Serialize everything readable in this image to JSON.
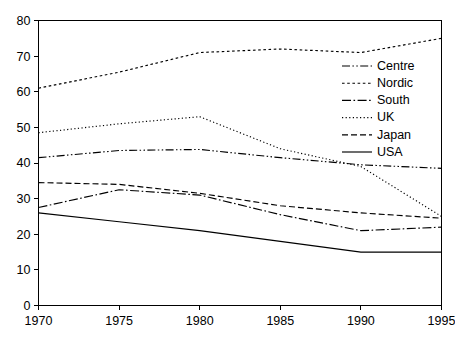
{
  "chart_data": {
    "type": "line",
    "title": "",
    "subtitle": "",
    "xlabel": "",
    "ylabel": "",
    "x": [
      1970,
      1975,
      1980,
      1985,
      1990,
      1995
    ],
    "xlim": [
      1970,
      1995
    ],
    "ylim": [
      0,
      80
    ],
    "x_ticks": [
      "1970",
      "1975",
      "1980",
      "1985",
      "1990",
      "1995"
    ],
    "y_ticks": [
      "0",
      "10",
      "20",
      "30",
      "40",
      "50",
      "60",
      "70",
      "80"
    ],
    "grid": false,
    "legend_position": "upper-right-inside",
    "line_color": "#000000",
    "background_color": "#ffffff",
    "series": [
      {
        "name": "Centre",
        "dash": "dash-dot-dot",
        "values": [
          41.5,
          43.5,
          43.8,
          41.5,
          39.5,
          38.5
        ]
      },
      {
        "name": "Nordic",
        "dash": "dotted-coarse",
        "values": [
          61.0,
          65.5,
          71.0,
          72.0,
          71.0,
          75.0
        ]
      },
      {
        "name": "South",
        "dash": "dash-dot",
        "values": [
          27.5,
          32.5,
          31.0,
          25.5,
          21.0,
          22.0
        ]
      },
      {
        "name": "UK",
        "dash": "dotted-fine",
        "values": [
          48.5,
          51.0,
          53.0,
          44.0,
          39.0,
          25.0
        ]
      },
      {
        "name": "Japan",
        "dash": "dashed",
        "values": [
          34.5,
          34.0,
          31.5,
          28.0,
          26.0,
          24.5
        ]
      },
      {
        "name": "USA",
        "dash": "solid",
        "values": [
          26.0,
          23.5,
          21.0,
          18.0,
          15.0,
          15.0
        ]
      }
    ]
  },
  "legend": {
    "items": [
      {
        "label": "Centre"
      },
      {
        "label": "Nordic"
      },
      {
        "label": "South"
      },
      {
        "label": "UK"
      },
      {
        "label": "Japan"
      },
      {
        "label": "USA"
      }
    ]
  },
  "axes": {
    "y_tick_labels": [
      "80",
      "70",
      "60",
      "50",
      "40",
      "30",
      "20",
      "10",
      "0"
    ],
    "x_tick_labels": [
      "1970",
      "1975",
      "1980",
      "1985",
      "1990",
      "1995"
    ]
  }
}
